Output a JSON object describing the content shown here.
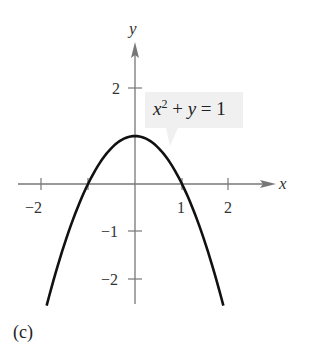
{
  "chart_data": {
    "type": "line",
    "title": "",
    "panel_label": "(c)",
    "equation_label": "x^2 + y = 1",
    "equation_parts": {
      "x": "x",
      "exp": "2",
      "rest": "+ y = 1"
    },
    "xlabel": "x",
    "ylabel": "y",
    "xlim": [
      -2.5,
      3
    ],
    "ylim": [
      -2.5,
      3
    ],
    "x_ticks": [
      -2,
      -1,
      1,
      2
    ],
    "x_tick_labels": [
      "−2",
      "1",
      "2"
    ],
    "y_ticks": [
      -2,
      -1,
      2
    ],
    "y_tick_labels": [
      "2",
      "−1",
      "−2"
    ],
    "grid": false,
    "series": [
      {
        "name": "x^2 + y = 1",
        "function": "y = 1 - x^2",
        "x": [
          -1.88,
          -1.5,
          -1,
          -0.5,
          0,
          0.5,
          1,
          1.5,
          1.88
        ],
        "values": [
          -2.53,
          -1.25,
          0,
          0.75,
          1,
          0.75,
          0,
          -1.25,
          -2.53
        ],
        "color": "#111111"
      }
    ]
  },
  "colors": {
    "axis": "#777777",
    "curve": "#111111",
    "label_box": "#f0f0f0"
  }
}
